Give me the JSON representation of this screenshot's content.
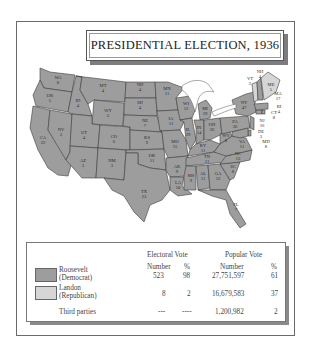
{
  "title": "PRESIDENTIAL ELECTION, 1936",
  "colors": {
    "democrat": "#9d9d9d",
    "republican": "#d6d6d6",
    "border": "#3c3c3c"
  },
  "map": {
    "states": [
      {
        "abbr": "WA",
        "ev": "8",
        "winner": "Roosevelt"
      },
      {
        "abbr": "OR",
        "ev": "5",
        "winner": "Roosevelt"
      },
      {
        "abbr": "CA",
        "ev": "22",
        "winner": "Roosevelt"
      },
      {
        "abbr": "ID",
        "ev": "4",
        "winner": "Roosevelt"
      },
      {
        "abbr": "NV",
        "ev": "3",
        "winner": "Roosevelt"
      },
      {
        "abbr": "MT",
        "ev": "4",
        "winner": "Roosevelt"
      },
      {
        "abbr": "WY",
        "ev": "3",
        "winner": "Roosevelt"
      },
      {
        "abbr": "UT",
        "ev": "4",
        "winner": "Roosevelt"
      },
      {
        "abbr": "AZ",
        "ev": "3",
        "winner": "Roosevelt"
      },
      {
        "abbr": "CO",
        "ev": "6",
        "winner": "Roosevelt"
      },
      {
        "abbr": "NM",
        "ev": "3",
        "winner": "Roosevelt"
      },
      {
        "abbr": "ND",
        "ev": "4",
        "winner": "Roosevelt"
      },
      {
        "abbr": "SD",
        "ev": "4",
        "winner": "Roosevelt"
      },
      {
        "abbr": "NE",
        "ev": "7",
        "winner": "Roosevelt"
      },
      {
        "abbr": "KS",
        "ev": "9",
        "winner": "Roosevelt"
      },
      {
        "abbr": "OK",
        "ev": "11",
        "winner": "Roosevelt"
      },
      {
        "abbr": "TX",
        "ev": "23",
        "winner": "Roosevelt"
      },
      {
        "abbr": "MN",
        "ev": "11",
        "winner": "Roosevelt"
      },
      {
        "abbr": "IA",
        "ev": "11",
        "winner": "Roosevelt"
      },
      {
        "abbr": "MO",
        "ev": "15",
        "winner": "Roosevelt"
      },
      {
        "abbr": "AR",
        "ev": "9",
        "winner": "Roosevelt"
      },
      {
        "abbr": "LA",
        "ev": "10",
        "winner": "Roosevelt"
      },
      {
        "abbr": "WI",
        "ev": "12",
        "winner": "Roosevelt"
      },
      {
        "abbr": "IL",
        "ev": "29",
        "winner": "Roosevelt"
      },
      {
        "abbr": "MI",
        "ev": "19",
        "winner": "Roosevelt"
      },
      {
        "abbr": "IN",
        "ev": "14",
        "winner": "Roosevelt"
      },
      {
        "abbr": "OH",
        "ev": "26",
        "winner": "Roosevelt"
      },
      {
        "abbr": "KY",
        "ev": "11",
        "winner": "Roosevelt"
      },
      {
        "abbr": "TN",
        "ev": "11",
        "winner": "Roosevelt"
      },
      {
        "abbr": "MS",
        "ev": "9",
        "winner": "Roosevelt"
      },
      {
        "abbr": "AL",
        "ev": "11",
        "winner": "Roosevelt"
      },
      {
        "abbr": "GA",
        "ev": "12",
        "winner": "Roosevelt"
      },
      {
        "abbr": "FL",
        "ev": "7",
        "winner": "Roosevelt"
      },
      {
        "abbr": "SC",
        "ev": "8",
        "winner": "Roosevelt"
      },
      {
        "abbr": "NC",
        "ev": "13",
        "winner": "Roosevelt"
      },
      {
        "abbr": "VA",
        "ev": "11",
        "winner": "Roosevelt"
      },
      {
        "abbr": "WV",
        "ev": "8",
        "winner": "Roosevelt"
      },
      {
        "abbr": "PA",
        "ev": "36",
        "winner": "Roosevelt"
      },
      {
        "abbr": "NY",
        "ev": "47",
        "winner": "Roosevelt"
      },
      {
        "abbr": "NJ",
        "ev": "16",
        "winner": "Roosevelt"
      },
      {
        "abbr": "DE",
        "ev": "3",
        "winner": "Roosevelt"
      },
      {
        "abbr": "MD",
        "ev": "8",
        "winner": "Roosevelt"
      },
      {
        "abbr": "CT",
        "ev": "8",
        "winner": "Roosevelt"
      },
      {
        "abbr": "RI",
        "ev": "4",
        "winner": "Roosevelt"
      },
      {
        "abbr": "MA",
        "ev": "17",
        "winner": "Roosevelt"
      },
      {
        "abbr": "NH",
        "ev": "4",
        "winner": "Roosevelt"
      },
      {
        "abbr": "VT",
        "ev": "3",
        "winner": "Landon"
      },
      {
        "abbr": "ME",
        "ev": "5",
        "winner": "Landon"
      }
    ]
  },
  "legend": {
    "headers": {
      "electoral_vote": "Electoral Vote",
      "popular_vote": "Popular Vote",
      "number": "Number",
      "percent": "%"
    },
    "rows": [
      {
        "name": "Roosevelt",
        "party": "(Democrat)",
        "ev_number": "523",
        "ev_percent": "98",
        "pv_number": "27,751,597",
        "pv_percent": "61",
        "swatch": "#9d9d9d"
      },
      {
        "name": "Landon",
        "party": "(Republican)",
        "ev_number": "8",
        "ev_percent": "2",
        "pv_number": "16,679,583",
        "pv_percent": "37",
        "swatch": "#d6d6d6"
      },
      {
        "name": "Third parties",
        "party": "",
        "ev_number": "---",
        "ev_percent": "----",
        "pv_number": "1,200,982",
        "pv_percent": "2"
      }
    ]
  }
}
